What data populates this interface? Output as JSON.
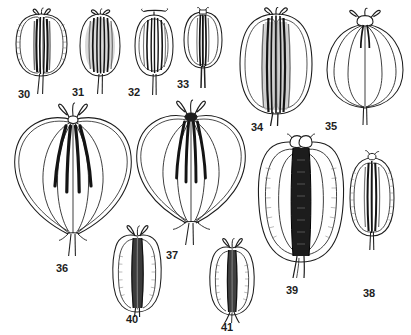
{
  "plate": {
    "type": "botanical-illustration-plate",
    "background_color": "#ffffff",
    "ink_color": "#1d1d1d",
    "width": 411,
    "height": 335,
    "label_count": 12,
    "subject": "line drawings of umbellifer fruits (mericarps) with styles and ribs"
  },
  "figures": [
    {
      "id": "fig-30",
      "label": "30",
      "row": 1,
      "shape": "broad oblong fruit with rounded shoulders, fine marginal hairs, dark central commissure with paired vittae, short divergent styles at apex, two-pronged pedicel below",
      "label_x": 18,
      "label_y": 88,
      "body_x": 8,
      "body_y": 10,
      "body_w": 66,
      "body_h": 66,
      "ribs": 4,
      "style_arms": 2,
      "pedicel": true,
      "hairy_margin": true,
      "dark_core": "strong"
    },
    {
      "id": "fig-31",
      "label": "31",
      "row": 1,
      "shape": "ovoid fruit, longitudinally striate with dense dark vittae filling the body, small forked stigmas at apex, slender pedicel",
      "label_x": 72,
      "label_y": 88,
      "body_x": 78,
      "body_y": 12,
      "body_w": 46,
      "body_h": 62,
      "ribs": 6,
      "style_arms": 2,
      "pedicel": true,
      "hairy_margin": false,
      "dark_core": "strong"
    },
    {
      "id": "fig-32",
      "label": "32",
      "row": 1,
      "shape": "elliptic fruit with narrow pale border and five dark longitudinal ribs, T-shaped spreading styles, straight pedicel",
      "label_x": 128,
      "label_y": 88,
      "body_x": 132,
      "body_y": 12,
      "body_w": 44,
      "body_h": 62,
      "ribs": 5,
      "style_arms": 2,
      "pedicel": true,
      "hairy_margin": false,
      "dark_core": "medium"
    },
    {
      "id": "fig-33",
      "label": "33",
      "row": 1,
      "shape": "small obovoid fruit with two lateral wings, dark narrow central column of vittae, short apical stylopodium, tapering pedicel",
      "label_x": 178,
      "label_y": 80,
      "body_x": 180,
      "body_y": 10,
      "body_w": 44,
      "body_h": 58,
      "ribs": 4,
      "style_arms": 2,
      "pedicel": true,
      "hairy_margin": false,
      "dark_core": "strong"
    },
    {
      "id": "fig-34",
      "label": "34",
      "row": 1,
      "shape": "large broadly oblong fruit, smooth outline, broad dark shaded central band of vittae running full length, tuft of styles at apex, stout pedicel",
      "label_x": 252,
      "label_y": 122,
      "body_x": 234,
      "body_y": 10,
      "body_w": 80,
      "body_h": 108,
      "ribs": 6,
      "style_arms": 2,
      "pedicel": true,
      "hairy_margin": false,
      "dark_core": "very-strong"
    },
    {
      "id": "fig-35",
      "label": "35",
      "row": 1,
      "shape": "large pale fruit outlined only, with thin curved ribs forming a lantern shape, short dark styles hanging from apical disc, long straight pedicel",
      "label_x": 325,
      "label_y": 122,
      "body_x": 326,
      "body_y": 12,
      "body_w": 74,
      "body_h": 102,
      "ribs": 5,
      "style_arms": 2,
      "pedicel": true,
      "hairy_margin": false,
      "dark_core": "none"
    },
    {
      "id": "fig-36",
      "label": "36",
      "row": 2,
      "shape": "large heart-shaped winged fruit; two broad lateral wings arching from apex to base, four thick club-shaped dark vittae in the centre, forked styles at top, split pedicel at base",
      "label_x": 57,
      "label_y": 263,
      "body_x": 14,
      "body_y": 104,
      "body_w": 112,
      "body_h": 140,
      "ribs": 4,
      "style_arms": 2,
      "pedicel": true,
      "hairy_margin": false,
      "dark_core": "strong"
    },
    {
      "id": "fig-37",
      "label": "37",
      "row": 2,
      "shape": "large heart-shaped winged fruit similar to 36, broad lateral wings, dark elongated vittae tapering downward, dark stylopodium, long forked pedicel",
      "label_x": 167,
      "label_y": 250,
      "body_x": 136,
      "body_y": 100,
      "body_w": 104,
      "body_h": 132,
      "ribs": 4,
      "style_arms": 2,
      "pedicel": true,
      "hairy_margin": false,
      "dark_core": "strong"
    },
    {
      "id": "fig-38",
      "label": "38",
      "row": 2,
      "shape": "oblong fruit with finely hairy ribbed margins and dark narrow central commissure, tiny apical stylopodium, short straight pedicel",
      "label_x": 364,
      "label_y": 288,
      "body_x": 345,
      "body_y": 152,
      "body_w": 54,
      "body_h": 92,
      "ribs": 4,
      "style_arms": 2,
      "pedicel": true,
      "hairy_margin": true,
      "dark_core": "strong"
    },
    {
      "id": "fig-39",
      "label": "39",
      "row": 2,
      "shape": "largest fruit of the plate; broadly oblong with four prominent corky wavy ribs and finely crenulate margins, very broad black granulate central band, paired knob-like stylopodia at apex, stout pedicel",
      "label_x": 287,
      "label_y": 285,
      "body_x": 256,
      "body_y": 136,
      "body_w": 88,
      "body_h": 134,
      "ribs": 4,
      "style_arms": 2,
      "pedicel": true,
      "hairy_margin": true,
      "dark_core": "very-strong"
    },
    {
      "id": "fig-40",
      "label": "40",
      "row": 3,
      "shape": "oblong ribbed fruit with crenulate lateral wings and dark spindle-shaped central vittae, slender forked styles above, tapering pedicel",
      "label_x": 127,
      "label_y": 314,
      "body_x": 110,
      "body_y": 228,
      "body_w": 50,
      "body_h": 80,
      "ribs": 4,
      "style_arms": 2,
      "pedicel": true,
      "hairy_margin": true,
      "dark_core": "strong"
    },
    {
      "id": "fig-41",
      "label": "41",
      "row": 3,
      "shape": "oblong ribbed fruit with crenulate wings, narrow dark central column, short divergent styles, two spreading pedicel branches at base",
      "label_x": 222,
      "label_y": 322,
      "body_x": 206,
      "body_y": 240,
      "body_w": 48,
      "body_h": 72,
      "ribs": 4,
      "style_arms": 2,
      "pedicel": true,
      "hairy_margin": true,
      "dark_core": "strong"
    }
  ]
}
